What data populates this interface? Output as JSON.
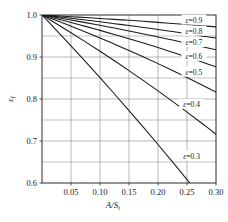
{
  "chart_data": {
    "type": "line",
    "title": "",
    "xlabel": "A/S_t",
    "xlabel_main": "A/S",
    "xlabel_sub": "t",
    "ylabel": "ε_f",
    "ylabel_main": "ε",
    "ylabel_sub": "f",
    "xlim": [
      0.0,
      0.3
    ],
    "ylim": [
      0.6,
      1.0
    ],
    "x_ticks": [
      0.05,
      0.1,
      0.15,
      0.2,
      0.25,
      0.3
    ],
    "x_tick_labels": [
      "0.05",
      "0.10",
      "0.15",
      "0.20",
      "0.25",
      "0.30"
    ],
    "x_minor_step": 0.05,
    "y_ticks": [
      0.6,
      0.7,
      0.8,
      0.9,
      1.0
    ],
    "y_tick_labels": [
      "0.6",
      "0.7",
      "0.8",
      "0.9",
      "1.0"
    ],
    "y_minor_ticks": [
      0.65,
      0.75,
      0.85,
      0.95
    ],
    "grid": true,
    "grid_color": "#9a9a9a",
    "line_color": "#1a1a1a",
    "legend_position": "inline-right-of-curve",
    "series": [
      {
        "name": "ε=0.9",
        "label": "ε=0.9",
        "epsilon": 0.9,
        "label_x": 0.262,
        "label_y": 0.988,
        "x": [
          0.0,
          0.025,
          0.05,
          0.075,
          0.1,
          0.125,
          0.15,
          0.175,
          0.2,
          0.225,
          0.25,
          0.275,
          0.3
        ],
        "y": [
          1.0,
          0.998,
          0.996,
          0.994,
          0.9918,
          0.9896,
          0.9873,
          0.9849,
          0.9824,
          0.9798,
          0.9772,
          0.9745,
          0.9717
        ]
      },
      {
        "name": "ε=0.8",
        "label": "ε=0.8",
        "epsilon": 0.8,
        "label_x": 0.262,
        "label_y": 0.9615,
        "x": [
          0.0,
          0.025,
          0.05,
          0.075,
          0.1,
          0.125,
          0.15,
          0.175,
          0.2,
          0.225,
          0.25,
          0.275,
          0.3
        ],
        "y": [
          1.0,
          0.9961,
          0.9921,
          0.988,
          0.9838,
          0.9794,
          0.9749,
          0.9703,
          0.9655,
          0.9606,
          0.9555,
          0.9503,
          0.945
        ]
      },
      {
        "name": "ε=0.7",
        "label": "ε=0.7",
        "epsilon": 0.7,
        "label_x": 0.262,
        "label_y": 0.9345,
        "x": [
          0.0,
          0.025,
          0.05,
          0.075,
          0.1,
          0.125,
          0.15,
          0.175,
          0.2,
          0.225,
          0.25,
          0.275,
          0.3
        ],
        "y": [
          1.0,
          0.9941,
          0.988,
          0.9818,
          0.9754,
          0.9688,
          0.962,
          0.955,
          0.9478,
          0.9404,
          0.9328,
          0.925,
          0.917
        ]
      },
      {
        "name": "ε=0.6",
        "label": "ε=0.6",
        "epsilon": 0.6,
        "label_x": 0.262,
        "label_y": 0.9015,
        "x": [
          0.0,
          0.025,
          0.05,
          0.075,
          0.1,
          0.125,
          0.15,
          0.175,
          0.2,
          0.225,
          0.25,
          0.275,
          0.3
        ],
        "y": [
          1.0,
          0.9912,
          0.9822,
          0.9729,
          0.9634,
          0.9536,
          0.9435,
          0.9331,
          0.9224,
          0.9114,
          0.9001,
          0.8885,
          0.8766
        ]
      },
      {
        "name": "ε=0.5",
        "label": "ε=0.5",
        "epsilon": 0.5,
        "label_x": 0.262,
        "label_y": 0.864,
        "x": [
          0.0,
          0.025,
          0.05,
          0.075,
          0.1,
          0.125,
          0.15,
          0.175,
          0.2,
          0.225,
          0.25,
          0.275,
          0.3
        ],
        "y": [
          1.0,
          0.9868,
          0.9733,
          0.9594,
          0.9452,
          0.9306,
          0.9156,
          0.9001,
          0.8842,
          0.8679,
          0.8512,
          0.834,
          0.8164
        ]
      },
      {
        "name": "ε=0.4",
        "label": "ε=0.4",
        "epsilon": 0.4,
        "label_x": 0.258,
        "label_y": 0.787,
        "x": [
          0.0,
          0.025,
          0.05,
          0.075,
          0.1,
          0.125,
          0.15,
          0.175,
          0.2,
          0.225,
          0.25,
          0.275,
          0.3
        ],
        "y": [
          1.0,
          0.9792,
          0.9579,
          0.9361,
          0.9138,
          0.891,
          0.8677,
          0.8438,
          0.8194,
          0.7944,
          0.7689,
          0.7428,
          0.7161
        ]
      },
      {
        "name": "ε=0.3",
        "label": "ε=0.3",
        "epsilon": 0.3,
        "label_x": 0.258,
        "label_y": 0.664,
        "x": [
          0.0,
          0.025,
          0.05,
          0.075,
          0.1,
          0.125,
          0.15,
          0.175,
          0.2,
          0.225,
          0.25,
          0.275,
          0.3
        ],
        "y": [
          1.0,
          0.9636,
          0.9266,
          0.889,
          0.8508,
          0.8119,
          0.7724,
          0.7323,
          0.6916,
          0.6502,
          0.6082,
          0.5656,
          0.5223
        ]
      }
    ]
  }
}
